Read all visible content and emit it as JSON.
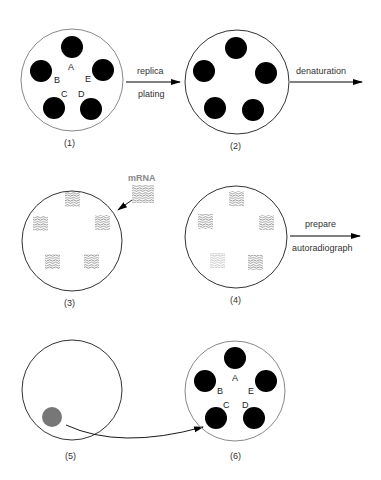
{
  "colors": {
    "ink": "#000000",
    "dish_outline": "#888888",
    "hatch": "#555555",
    "hatch_faint": "#999999",
    "picked_colony": "#777777"
  },
  "steps": [
    {
      "id": 1,
      "caption": "(1)",
      "colonies": [
        "A",
        "B",
        "C",
        "D",
        "E"
      ]
    },
    {
      "id": 2,
      "caption": "(2)"
    },
    {
      "id": 3,
      "caption": "(3)",
      "annotation": "mRNA"
    },
    {
      "id": 4,
      "caption": "(4)"
    },
    {
      "id": 5,
      "caption": "(5)"
    },
    {
      "id": 6,
      "caption": "(6)",
      "colonies": [
        "A",
        "B",
        "C",
        "D",
        "E"
      ]
    }
  ],
  "arrows": {
    "a1_top": "replica",
    "a1_bottom": "plating",
    "a2_top": "denaturation",
    "a3_top": "prepare",
    "a3_bottom": "autoradiograph"
  },
  "letters": {
    "A": "A",
    "B": "B",
    "C": "C",
    "D": "D",
    "E": "E"
  }
}
